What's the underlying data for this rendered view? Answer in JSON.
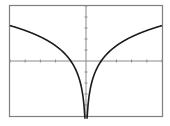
{
  "chart_data": {
    "type": "line",
    "title": "",
    "xlabel": "",
    "ylabel": "",
    "function": "y = 2 ln|x|",
    "xlim": [
      -5,
      5
    ],
    "ylim": [
      -5,
      5
    ],
    "x_tick_step": 1,
    "y_tick_step": 1,
    "grid": false,
    "legend": null,
    "series": [
      {
        "name": "y = 2 ln|x|",
        "x": [
          -5,
          -4,
          -3,
          -2,
          -1.5,
          -1,
          -0.75,
          -0.5,
          -0.3,
          -0.2,
          -0.1,
          0.1,
          0.2,
          0.3,
          0.5,
          0.75,
          1,
          1.5,
          2,
          3,
          4,
          5
        ],
        "values": [
          3.22,
          2.77,
          2.2,
          1.39,
          0.81,
          0,
          -0.58,
          -1.39,
          -2.41,
          -3.22,
          -4.61,
          -4.61,
          -3.22,
          -2.41,
          -1.39,
          -0.58,
          0,
          0.81,
          1.39,
          2.2,
          2.77,
          3.22
        ]
      }
    ],
    "annotations": [
      "vertical asymptote at x = 0",
      "x-intercepts at x = -1 and x = 1"
    ]
  },
  "colors": {
    "background": "#ffffff",
    "frame": "#7f7f7f",
    "axes": "#8a8a8a",
    "curve": "#1a1a1a"
  }
}
